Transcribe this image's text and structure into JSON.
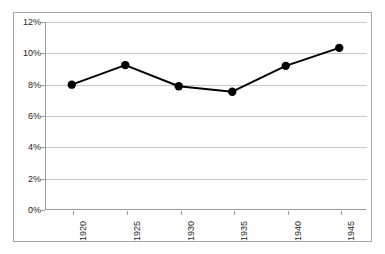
{
  "chart_data": {
    "type": "line",
    "title": "",
    "subtitle": "",
    "xlabel": "",
    "ylabel": "",
    "categories": [
      "1920",
      "1925",
      "1930",
      "1935",
      "1940",
      "1945"
    ],
    "x": [
      1920,
      1925,
      1930,
      1935,
      1940,
      1945
    ],
    "values": [
      8.0,
      9.25,
      7.9,
      7.55,
      9.2,
      10.35
    ],
    "series": [
      {
        "name": "",
        "values": [
          8.0,
          9.25,
          7.9,
          7.55,
          9.2,
          10.35
        ]
      }
    ],
    "ylim": [
      0,
      12
    ],
    "ytick_values": [
      0,
      2,
      4,
      6,
      8,
      10,
      12
    ],
    "ytick_labels": [
      "0%",
      "2%",
      "4%",
      "6%",
      "8%",
      "10%",
      "12%"
    ],
    "xtick_labels": [
      "1920",
      "1925",
      "1930",
      "1935",
      "1940",
      "1945"
    ],
    "xtick_rotation": -90,
    "grid": "horizontal",
    "legend": "none",
    "annotations": [],
    "colors": {
      "line": "#000000",
      "marker": "#000000",
      "gridline": "#c8c8c8",
      "axis": "#9c9c9c",
      "frame": "#a6a6a6",
      "plot_background": "#ffffff",
      "text": "#252525"
    },
    "marker": "circle",
    "line_width": 2
  }
}
